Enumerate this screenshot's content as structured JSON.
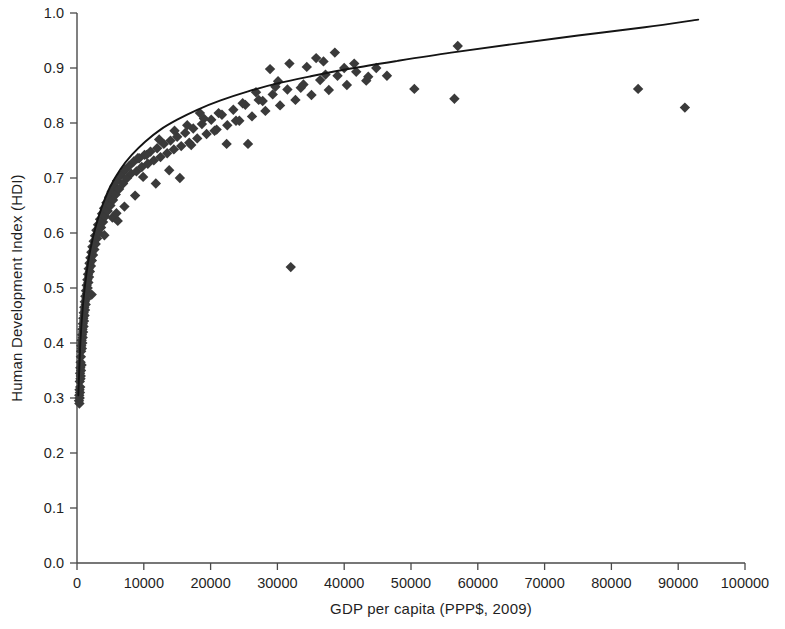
{
  "chart_data": {
    "type": "scatter",
    "title": "",
    "xlabel": "GDP per capita  (PPP$, 2009)",
    "ylabel": "Human Development Index (HDI)",
    "xlim": [
      0,
      100000
    ],
    "ylim": [
      0.0,
      1.0
    ],
    "xticks": [
      0,
      10000,
      20000,
      30000,
      40000,
      50000,
      60000,
      70000,
      80000,
      90000,
      100000
    ],
    "xtick_labels": [
      "0",
      "10000",
      "20000",
      "30000",
      "40000",
      "50000",
      "60000",
      "70000",
      "80000",
      "90000",
      "100000"
    ],
    "yticks": [
      0.0,
      0.1,
      0.2,
      0.3,
      0.4,
      0.5,
      0.6,
      0.7,
      0.8,
      0.9,
      1.0
    ],
    "ytick_labels": [
      "0.0",
      "0.1",
      "0.2",
      "0.3",
      "0.4",
      "0.5",
      "0.6",
      "0.7",
      "0.8",
      "0.9",
      "1.0"
    ],
    "grid": false,
    "legend": false,
    "marker_shape": "diamond",
    "marker_color": "#3a3a3a",
    "curve_color": "#141414",
    "series": [
      {
        "name": "Countries",
        "points": [
          [
            300,
            0.295
          ],
          [
            340,
            0.305
          ],
          [
            360,
            0.29
          ],
          [
            380,
            0.315
          ],
          [
            400,
            0.3
          ],
          [
            420,
            0.33
          ],
          [
            440,
            0.31
          ],
          [
            460,
            0.345
          ],
          [
            480,
            0.32
          ],
          [
            500,
            0.355
          ],
          [
            520,
            0.335
          ],
          [
            540,
            0.365
          ],
          [
            560,
            0.34
          ],
          [
            580,
            0.375
          ],
          [
            600,
            0.35
          ],
          [
            620,
            0.385
          ],
          [
            650,
            0.395
          ],
          [
            680,
            0.36
          ],
          [
            700,
            0.405
          ],
          [
            730,
            0.39
          ],
          [
            760,
            0.415
          ],
          [
            790,
            0.4
          ],
          [
            820,
            0.425
          ],
          [
            850,
            0.41
          ],
          [
            880,
            0.435
          ],
          [
            910,
            0.42
          ],
          [
            950,
            0.445
          ],
          [
            980,
            0.43
          ],
          [
            1010,
            0.455
          ],
          [
            1050,
            0.44
          ],
          [
            1090,
            0.465
          ],
          [
            1130,
            0.45
          ],
          [
            1170,
            0.475
          ],
          [
            1200,
            0.46
          ],
          [
            1250,
            0.485
          ],
          [
            1300,
            0.47
          ],
          [
            1350,
            0.495
          ],
          [
            1400,
            0.48
          ],
          [
            1450,
            0.505
          ],
          [
            1500,
            0.49
          ],
          [
            1550,
            0.515
          ],
          [
            1600,
            0.5
          ],
          [
            1650,
            0.525
          ],
          [
            1700,
            0.51
          ],
          [
            1750,
            0.535
          ],
          [
            1800,
            0.52
          ],
          [
            1870,
            0.545
          ],
          [
            1930,
            0.53
          ],
          [
            2000,
            0.555
          ],
          [
            2080,
            0.54
          ],
          [
            2150,
            0.565
          ],
          [
            2230,
            0.55
          ],
          [
            2300,
            0.575
          ],
          [
            2400,
            0.56
          ],
          [
            2500,
            0.585
          ],
          [
            2600,
            0.57
          ],
          [
            2700,
            0.595
          ],
          [
            2800,
            0.58
          ],
          [
            2900,
            0.605
          ],
          [
            3000,
            0.59
          ],
          [
            3150,
            0.615
          ],
          [
            3300,
            0.6
          ],
          [
            3450,
            0.625
          ],
          [
            3600,
            0.61
          ],
          [
            3750,
            0.635
          ],
          [
            3900,
            0.62
          ],
          [
            4050,
            0.645
          ],
          [
            4200,
            0.63
          ],
          [
            4400,
            0.655
          ],
          [
            4600,
            0.64
          ],
          [
            4800,
            0.665
          ],
          [
            5000,
            0.65
          ],
          [
            5200,
            0.675
          ],
          [
            5400,
            0.66
          ],
          [
            5600,
            0.685
          ],
          [
            5800,
            0.67
          ],
          [
            6000,
            0.695
          ],
          [
            6300,
            0.68
          ],
          [
            6600,
            0.705
          ],
          [
            6900,
            0.69
          ],
          [
            7200,
            0.715
          ],
          [
            7500,
            0.7
          ],
          [
            7800,
            0.722
          ],
          [
            8100,
            0.708
          ],
          [
            8500,
            0.73
          ],
          [
            8900,
            0.712
          ],
          [
            9300,
            0.736
          ],
          [
            9700,
            0.72
          ],
          [
            10100,
            0.742
          ],
          [
            10600,
            0.726
          ],
          [
            11000,
            0.748
          ],
          [
            11500,
            0.732
          ],
          [
            12000,
            0.754
          ],
          [
            12500,
            0.738
          ],
          [
            13000,
            0.762
          ],
          [
            13500,
            0.745
          ],
          [
            14000,
            0.768
          ],
          [
            14500,
            0.752
          ],
          [
            15000,
            0.775
          ],
          [
            15600,
            0.758
          ],
          [
            16200,
            0.782
          ],
          [
            16800,
            0.764
          ],
          [
            17400,
            0.79
          ],
          [
            18000,
            0.772
          ],
          [
            18700,
            0.798
          ],
          [
            19400,
            0.78
          ],
          [
            20100,
            0.806
          ],
          [
            20900,
            0.788
          ],
          [
            21700,
            0.815
          ],
          [
            22500,
            0.796
          ],
          [
            23400,
            0.824
          ],
          [
            24300,
            0.804
          ],
          [
            25200,
            0.833
          ],
          [
            26200,
            0.812
          ],
          [
            27200,
            0.842
          ],
          [
            28200,
            0.822
          ],
          [
            29300,
            0.852
          ],
          [
            30400,
            0.832
          ],
          [
            31500,
            0.861
          ],
          [
            32700,
            0.842
          ],
          [
            33900,
            0.87
          ],
          [
            35100,
            0.851
          ],
          [
            36400,
            0.878
          ],
          [
            37700,
            0.86
          ],
          [
            39000,
            0.886
          ],
          [
            40400,
            0.869
          ],
          [
            41800,
            0.893
          ],
          [
            43300,
            0.877
          ],
          [
            44800,
            0.9
          ],
          [
            46400,
            0.886
          ],
          [
            2200,
            0.488
          ],
          [
            4100,
            0.596
          ],
          [
            5300,
            0.628
          ],
          [
            6100,
            0.622
          ],
          [
            8700,
            0.668
          ],
          [
            9900,
            0.702
          ],
          [
            11800,
            0.69
          ],
          [
            13800,
            0.714
          ],
          [
            15400,
            0.7
          ],
          [
            17100,
            0.76
          ],
          [
            19000,
            0.808
          ],
          [
            20600,
            0.786
          ],
          [
            22400,
            0.762
          ],
          [
            24800,
            0.836
          ],
          [
            26800,
            0.856
          ],
          [
            28900,
            0.898
          ],
          [
            30100,
            0.876
          ],
          [
            31800,
            0.908
          ],
          [
            33500,
            0.864
          ],
          [
            35800,
            0.918
          ],
          [
            37200,
            0.888
          ],
          [
            38600,
            0.928
          ],
          [
            40000,
            0.9
          ],
          [
            41500,
            0.908
          ],
          [
            43600,
            0.884
          ],
          [
            5900,
            0.636
          ],
          [
            7100,
            0.648
          ],
          [
            9100,
            0.736
          ],
          [
            10400,
            0.742
          ],
          [
            12300,
            0.77
          ],
          [
            14600,
            0.786
          ],
          [
            16500,
            0.796
          ],
          [
            18400,
            0.818
          ],
          [
            21200,
            0.818
          ],
          [
            23800,
            0.804
          ],
          [
            25600,
            0.762
          ],
          [
            27800,
            0.84
          ],
          [
            29700,
            0.866
          ],
          [
            34400,
            0.902
          ],
          [
            36900,
            0.912
          ],
          [
            32000,
            0.538
          ],
          [
            50500,
            0.862
          ],
          [
            57000,
            0.94
          ],
          [
            56500,
            0.844
          ],
          [
            84000,
            0.862
          ],
          [
            91000,
            0.828
          ]
        ]
      }
    ],
    "fit_curve": {
      "name": "Logarithmic trend",
      "description": "Fitted logarithmic curve through scatter",
      "points": [
        [
          200,
          0.305
        ],
        [
          500,
          0.4
        ],
        [
          900,
          0.47
        ],
        [
          1400,
          0.525
        ],
        [
          2000,
          0.57
        ],
        [
          2800,
          0.612
        ],
        [
          3800,
          0.65
        ],
        [
          5000,
          0.685
        ],
        [
          6500,
          0.716
        ],
        [
          8200,
          0.742
        ],
        [
          10200,
          0.766
        ],
        [
          12500,
          0.788
        ],
        [
          15000,
          0.806
        ],
        [
          18000,
          0.824
        ],
        [
          21500,
          0.841
        ],
        [
          25500,
          0.857
        ],
        [
          30000,
          0.872
        ],
        [
          35000,
          0.885
        ],
        [
          41000,
          0.899
        ],
        [
          48000,
          0.913
        ],
        [
          56000,
          0.928
        ],
        [
          65000,
          0.943
        ],
        [
          75000,
          0.959
        ],
        [
          85000,
          0.974
        ],
        [
          93000,
          0.988
        ]
      ]
    }
  },
  "axes": {
    "x_axis_name": "gdp-axis",
    "y_axis_name": "hdi-axis"
  }
}
